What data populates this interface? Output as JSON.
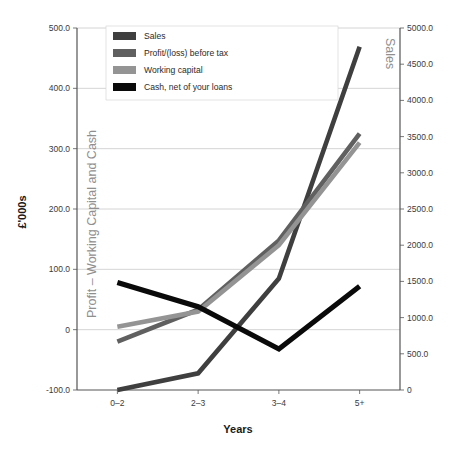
{
  "chart_data": {
    "type": "line",
    "title": "",
    "xlabel": "Years",
    "ylabel": "£'000s",
    "categories": [
      "0–2",
      "2–3",
      "3–4",
      "5+"
    ],
    "grid": true,
    "legend_position": "top-left-inside",
    "axes": {
      "left": {
        "label": "Profit – Working Capital and Cash",
        "min": -100,
        "max": 500,
        "step": 100,
        "tick_labels": [
          "500.0",
          "400.0",
          "300.0",
          "200.0",
          "100.0",
          "0",
          "-100.0"
        ],
        "tick_values": [
          500,
          400,
          300,
          200,
          100,
          0,
          -100
        ]
      },
      "right": {
        "label": "Sales",
        "min": 0,
        "max": 5000,
        "step": 500,
        "tick_labels": [
          "5000.0",
          "4500.0",
          "4000.0",
          "3500.0",
          "3000.0",
          "2500.0",
          "2000.0",
          "1500.0",
          "1000.0",
          "500.0",
          "0"
        ],
        "tick_values": [
          5000,
          4500,
          4000,
          3500,
          3000,
          2500,
          2000,
          1500,
          1000,
          500,
          0
        ]
      }
    },
    "series": [
      {
        "name": "Sales",
        "axis": "right",
        "color": "#3f3f3f",
        "values": [
          0,
          230,
          1540,
          4740
        ],
        "values_left_scale": [
          -90,
          -62,
          95,
          470
        ]
      },
      {
        "name": "Profit/(loss) before tax",
        "axis": "left",
        "color": "#606060",
        "values": [
          -20,
          33,
          148,
          325
        ]
      },
      {
        "name": "Working capital",
        "axis": "left",
        "color": "#949494",
        "values": [
          5,
          30,
          140,
          310
        ]
      },
      {
        "name": "Cash, net of your loans",
        "axis": "left",
        "color": "#0a0a0a",
        "values": [
          78,
          38,
          -32,
          72
        ]
      }
    ]
  },
  "legend": {
    "items": [
      {
        "label": "Sales",
        "color": "#3f3f3f"
      },
      {
        "label": "Profit/(loss) before tax",
        "color": "#606060"
      },
      {
        "label": "Working capital",
        "color": "#949494"
      },
      {
        "label": "Cash, net of your loans",
        "color": "#0a0a0a"
      }
    ]
  },
  "colors": {
    "background": "#ffffff",
    "grid": "#c9c9c9",
    "axis": "#545454",
    "inplot_label": "#8f8f8f",
    "text": "#2b2b2b"
  }
}
